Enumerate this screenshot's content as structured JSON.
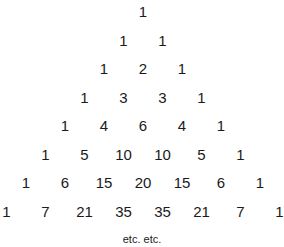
{
  "rows": [
    [
      1
    ],
    [
      1,
      1
    ],
    [
      1,
      2,
      1
    ],
    [
      1,
      3,
      3,
      1
    ],
    [
      1,
      4,
      6,
      4,
      1
    ],
    [
      1,
      5,
      10,
      10,
      5,
      1
    ],
    [
      1,
      6,
      15,
      20,
      15,
      6,
      1
    ],
    [
      1,
      7,
      21,
      35,
      35,
      21,
      7,
      1
    ]
  ],
  "footer": "etc. etc."
}
